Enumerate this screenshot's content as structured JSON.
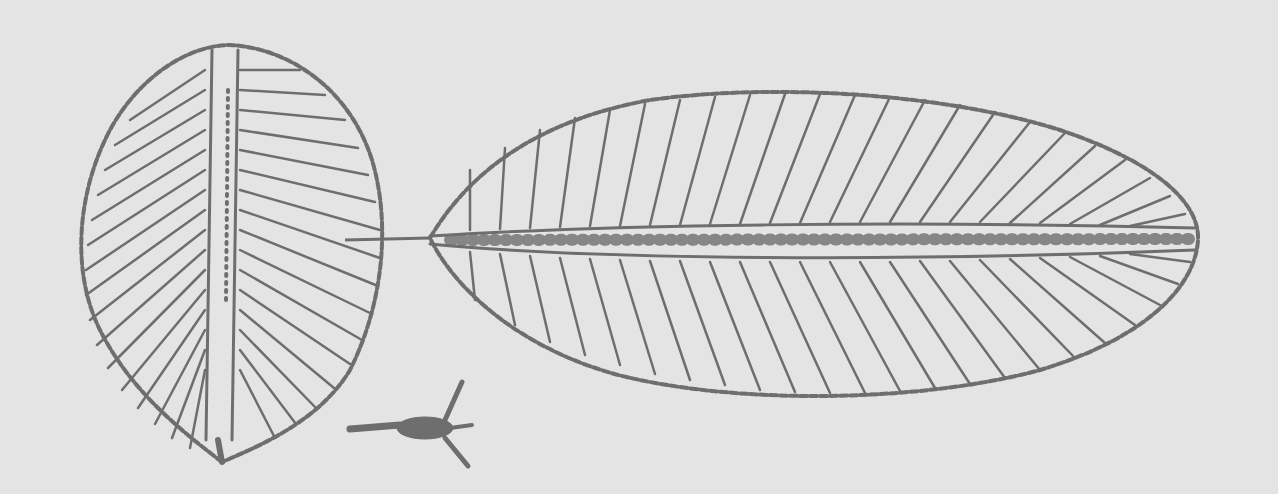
{
  "figure": {
    "kind": "woodcut botanical/zoological illustration",
    "colors": {
      "background": "#e4e4e4",
      "ink": "#6e6e6e"
    },
    "elements": [
      {
        "name": "round-leaf",
        "description": "ovate serrated leaf with central midrib and radiating veins"
      },
      {
        "name": "long-leaf",
        "description": "elongated oblong serrated leaf with central midrib and pinnate veins"
      },
      {
        "name": "small-organism",
        "description": "small insect-like creature with three limbs"
      }
    ]
  }
}
